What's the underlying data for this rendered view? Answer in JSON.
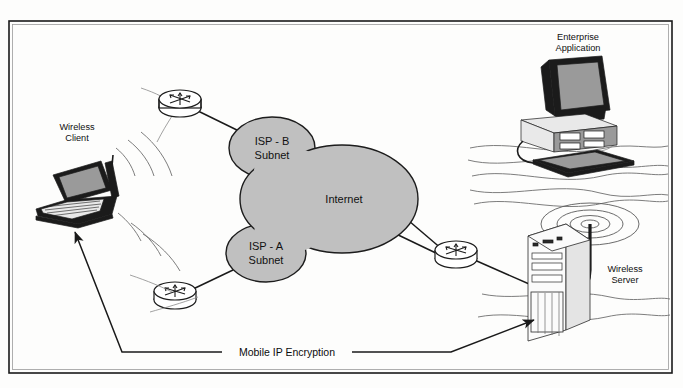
{
  "diagram": {
    "frame": {
      "present": true,
      "border_color": "#1a1a1a"
    },
    "background_color": "#fdfdfc",
    "cloud_fill_color": "#c0c0c0",
    "line_color": "#1a1a1a",
    "nodes": [
      {
        "id": "wireless-client",
        "label_lines": [
          "Wireless",
          "Client"
        ],
        "label": "Wireless Client",
        "icon": "laptop-icon",
        "x": 78,
        "y": 190
      },
      {
        "id": "enterprise-application",
        "label_lines": [
          "Enterprise",
          "Application"
        ],
        "label": "Enterprise Application",
        "icon": "desktop-computer-icon",
        "x": 578,
        "y": 95
      },
      {
        "id": "wireless-server",
        "label_lines": [
          "Wireless",
          "Server"
        ],
        "label": "Wireless Server",
        "icon": "tower-server-icon",
        "x": 555,
        "y": 275
      },
      {
        "id": "router-top-left",
        "label": "",
        "icon": "router-icon",
        "x": 180,
        "y": 103
      },
      {
        "id": "router-bottom-left",
        "label": "",
        "icon": "router-icon",
        "x": 175,
        "y": 297
      },
      {
        "id": "router-right",
        "label": "",
        "icon": "router-icon",
        "x": 456,
        "y": 253
      }
    ],
    "clouds": [
      {
        "id": "isp-b-subnet",
        "label_lines": [
          "ISP - B",
          "Subnet"
        ],
        "label": "ISP - B Subnet",
        "cx": 272,
        "cy": 148
      },
      {
        "id": "internet",
        "label_lines": [
          "Internet"
        ],
        "label": "Internet",
        "cx": 342,
        "cy": 199
      },
      {
        "id": "isp-a-subnet",
        "label_lines": [
          "ISP - A",
          "Subnet"
        ],
        "label": "ISP - A Subnet",
        "cx": 266,
        "cy": 253
      }
    ],
    "caption": {
      "id": "mobile-ip-encryption",
      "text": "Mobile IP Encryption",
      "x": 287,
      "y": 352,
      "arrow_targets": [
        "wireless-client",
        "wireless-server"
      ]
    },
    "links": [
      {
        "from": "router-top-left",
        "to": "isp-b-subnet"
      },
      {
        "from": "router-bottom-left",
        "to": "isp-a-subnet"
      },
      {
        "from": "internet",
        "to": "router-right"
      },
      {
        "from": "internet",
        "to": "router-right"
      },
      {
        "from": "router-right",
        "to": "wireless-server"
      }
    ]
  }
}
